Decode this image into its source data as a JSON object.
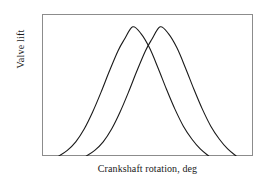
{
  "chart_data": {
    "type": "line",
    "title": "",
    "subtitle": "",
    "xlabel": "Crankshaft rotation, deg",
    "ylabel": "Valve lift",
    "grid": false,
    "legend": "none",
    "axis_ticks": "none",
    "xlim": [
      0,
      100
    ],
    "ylim": [
      0,
      100
    ],
    "frame_color": "#8c8c8c",
    "curve_color": "#1a1a1a",
    "background_color": "#ffffff",
    "series": [
      {
        "name": "Exhaust valve lift",
        "peak_x": 43,
        "peak_y": 91,
        "start_x": 8,
        "end_x": 79,
        "points": [
          [
            8,
            0
          ],
          [
            12,
            4
          ],
          [
            16,
            10
          ],
          [
            20,
            19
          ],
          [
            24,
            31
          ],
          [
            28,
            45
          ],
          [
            32,
            60
          ],
          [
            36,
            74
          ],
          [
            39,
            82
          ],
          [
            43,
            91
          ],
          [
            47,
            86
          ],
          [
            51,
            76
          ],
          [
            55,
            62
          ],
          [
            59,
            47
          ],
          [
            63,
            33
          ],
          [
            67,
            21
          ],
          [
            71,
            12
          ],
          [
            75,
            5
          ],
          [
            79,
            0
          ]
        ]
      },
      {
        "name": "Intake valve lift",
        "peak_x": 56,
        "peak_y": 91,
        "start_x": 21,
        "end_x": 92,
        "points": [
          [
            21,
            0
          ],
          [
            25,
            4
          ],
          [
            29,
            10
          ],
          [
            33,
            19
          ],
          [
            37,
            31
          ],
          [
            41,
            45
          ],
          [
            45,
            60
          ],
          [
            49,
            74
          ],
          [
            52,
            82
          ],
          [
            56,
            91
          ],
          [
            60,
            86
          ],
          [
            64,
            76
          ],
          [
            68,
            62
          ],
          [
            72,
            47
          ],
          [
            76,
            33
          ],
          [
            80,
            21
          ],
          [
            84,
            12
          ],
          [
            88,
            5
          ],
          [
            92,
            0
          ]
        ]
      }
    ],
    "annotations": []
  },
  "figure": {
    "y_axis_title": "Valve lift",
    "x_axis_title": "Crankshaft rotation, deg"
  }
}
